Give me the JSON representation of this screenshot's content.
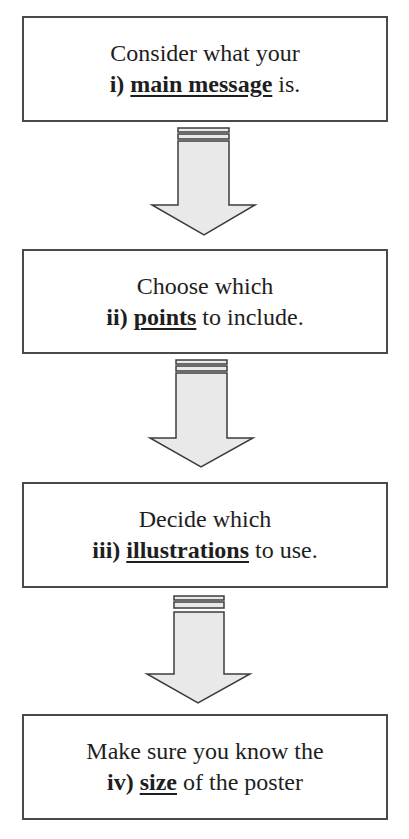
{
  "diagram": {
    "type": "flowchart",
    "direction": "top-to-bottom",
    "colors": {
      "box_border": "#4a4a4a",
      "box_fill": "#ffffff",
      "text": "#1e1e1e",
      "arrow_fill": "#e9e9e9",
      "arrow_stroke": "#3c3c3c"
    },
    "steps": [
      {
        "line1": "Consider what your",
        "number": "i)",
        "keyword": "main message",
        "suffix": " is."
      },
      {
        "line1": "Choose which",
        "number": "ii)",
        "keyword": "points",
        "suffix": " to include."
      },
      {
        "line1": "Decide which",
        "number": "iii)",
        "keyword": "illustrations",
        "suffix": " to use."
      },
      {
        "line1": "Make sure you know the",
        "number": "iv)",
        "keyword": "size",
        "suffix": " of the poster"
      }
    ],
    "connectors": [
      {
        "from": 0,
        "to": 1,
        "icon": "striped-down-arrow-icon"
      },
      {
        "from": 1,
        "to": 2,
        "icon": "striped-down-arrow-icon"
      },
      {
        "from": 2,
        "to": 3,
        "icon": "striped-down-arrow-icon"
      }
    ]
  }
}
